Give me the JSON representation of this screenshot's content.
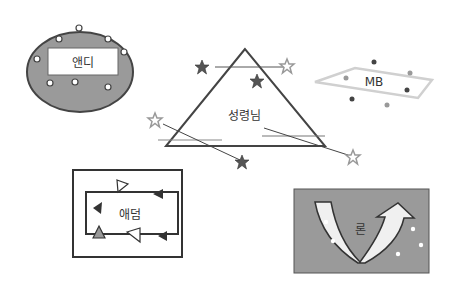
{
  "figures": {
    "oval": {
      "label": "앤디",
      "fill": "#9a9a9a",
      "stroke": "#444444"
    },
    "triangle": {
      "label": "성령님",
      "stroke": "#444444"
    },
    "parallelogram": {
      "label": "MB",
      "stroke": "#cccccc"
    },
    "rectangle": {
      "label": "애덤",
      "stroke": "#333333"
    },
    "arrow_box": {
      "label": "론",
      "fill": "#9a9a9a",
      "stroke": "#555555"
    }
  },
  "colors": {
    "dark_star": "#555555",
    "light_star": "#aaaaaa",
    "dot_dark": "#444444",
    "dot_light": "#999999"
  }
}
